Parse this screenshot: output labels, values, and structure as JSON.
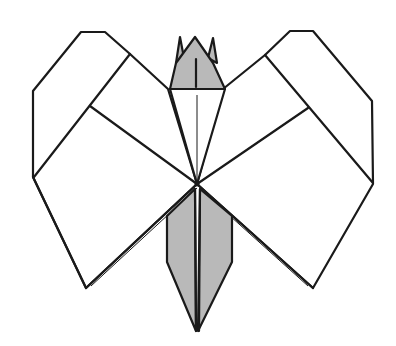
{
  "diagram": {
    "title": "Origami butterfly (finished model)",
    "subject": "butterfly",
    "colors": {
      "line": "#1a1a1a",
      "paper_front": "#ffffff",
      "paper_back": "#b9b9b9",
      "background": "#ffffff"
    },
    "parts": [
      {
        "name": "left-upper-wing",
        "shade": "white"
      },
      {
        "name": "left-lower-wing",
        "shade": "white"
      },
      {
        "name": "right-upper-wing",
        "shade": "white"
      },
      {
        "name": "right-lower-wing",
        "shade": "white"
      },
      {
        "name": "head",
        "shade": "gray"
      },
      {
        "name": "antennae",
        "count": 2,
        "shade": "gray"
      },
      {
        "name": "body",
        "shade": "gray"
      }
    ]
  }
}
